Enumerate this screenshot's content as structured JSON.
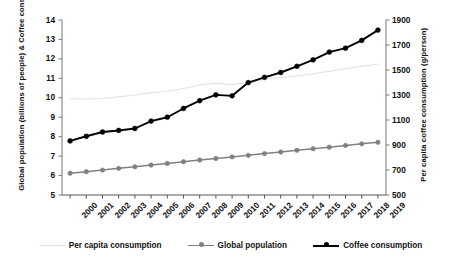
{
  "chart_data": {
    "type": "line",
    "title": "",
    "xlabel": "",
    "categories": [
      "2000",
      "2001",
      "2002",
      "2003",
      "2004",
      "2005",
      "2006",
      "2007",
      "2008",
      "2009",
      "2010",
      "2011",
      "2012",
      "2013",
      "2014",
      "2015",
      "2016",
      "2017",
      "2018",
      "2019"
    ],
    "grid": false,
    "legend_position": "bottom",
    "axes": {
      "left": {
        "label": "Global population (billions of people) & Coffee consumption (Tg)",
        "ticks": [
          5,
          6,
          7,
          8,
          9,
          10,
          11,
          12,
          13,
          14
        ],
        "ylim": [
          5,
          14
        ]
      },
      "right": {
        "label": "Per capita coffee consumption (g/person)",
        "ticks": [
          500,
          700,
          900,
          1100,
          1300,
          1500,
          1700,
          1900
        ],
        "ylim": [
          500,
          1900
        ]
      }
    },
    "series": [
      {
        "name": "Per capita consumption",
        "axis": "right",
        "color": "#e2e2e2",
        "marker": "none",
        "values": [
          1270,
          1268,
          1272,
          1285,
          1300,
          1318,
          1330,
          1352,
          1380,
          1395,
          1383,
          1400,
          1425,
          1440,
          1452,
          1470,
          1490,
          1510,
          1530,
          1548
        ]
      },
      {
        "name": "Global population",
        "axis": "left",
        "color": "#808080",
        "marker": "circle",
        "values": [
          6.12,
          6.2,
          6.28,
          6.37,
          6.45,
          6.54,
          6.62,
          6.71,
          6.8,
          6.88,
          6.96,
          7.04,
          7.13,
          7.21,
          7.3,
          7.38,
          7.46,
          7.55,
          7.63,
          7.71
        ]
      },
      {
        "name": "Coffee consumption",
        "axis": "left",
        "color": "#000000",
        "marker": "circle",
        "values": [
          7.78,
          8.02,
          8.24,
          8.32,
          8.42,
          8.8,
          9.0,
          9.45,
          9.85,
          10.15,
          10.1,
          10.78,
          11.05,
          11.3,
          11.62,
          11.95,
          12.35,
          12.55,
          12.95,
          13.48
        ]
      }
    ]
  }
}
